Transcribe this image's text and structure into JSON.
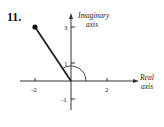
{
  "problem_number": "11.",
  "axes": {
    "x_label_line1": "Real",
    "x_label_line2": "axis",
    "y_label_line1": "Imaginary",
    "y_label_line2": "axis",
    "x_ticks": [
      {
        "value": -2,
        "label": "-2"
      },
      {
        "value": 2,
        "label": "2"
      }
    ],
    "y_ticks": [
      {
        "value": 3,
        "label": "3"
      },
      {
        "value": 1,
        "label": "1"
      },
      {
        "value": -1,
        "label": "-1"
      }
    ]
  },
  "point": {
    "x": -2,
    "y": 3
  },
  "angle_arc": "from positive real axis counterclockwise to the segment",
  "colors": {
    "ink": "#222222",
    "background": "#ffffff"
  }
}
